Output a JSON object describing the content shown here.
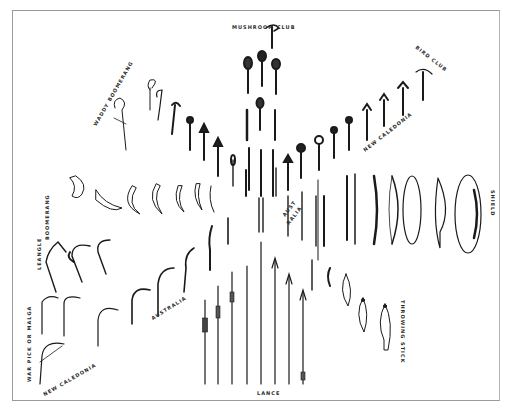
{
  "plate": {
    "background": "#ffffff",
    "ink": "#1a1a1a",
    "frame_color": "#9a9a9a"
  },
  "labels": {
    "mushroom_club": "MUSHROOM CLUB",
    "bird_club": "BIRD CLUB",
    "waddy_boomerang": "WADDY BOOMERANG",
    "boomerang": "BOOMERANG",
    "leangle": "LEANGLE",
    "war_pick": "WAR PICK OR MALGA",
    "new_caledonia_left": "NEW CALEDONIA",
    "australia": "AUSTRALIA",
    "austr": "AUST",
    "ralia": "RALIA",
    "new_caledonia_right": "NEW CALEDONIA",
    "shield": "SHIELD",
    "throwing_stick": "THROWING STICK",
    "lance": "LANCE"
  }
}
